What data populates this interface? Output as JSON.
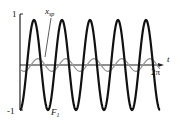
{
  "chart_data": {
    "type": "line",
    "title": "",
    "xlabel": "t",
    "ylabel": "",
    "x_range": [
      0,
      6.2832
    ],
    "xlim": [
      0,
      6.2832
    ],
    "ylim": [
      -1,
      1
    ],
    "grid": false,
    "legend": "none (inline labels)",
    "x_tick_labels": [
      "2π"
    ],
    "y_tick_labels": [
      "1",
      "-1"
    ],
    "series": [
      {
        "name": "F1",
        "label": "F₁",
        "color": "#111111",
        "width": 2.2,
        "formula": "-cos(5t)",
        "amplitude": 1.0,
        "frequency": 5,
        "phase": 0
      },
      {
        "name": "x_sp",
        "label": "x_sp",
        "color": "#9a9a9a",
        "width": 1.3,
        "formula": "-0.14*cos(5t - 0.9)",
        "amplitude": 0.14,
        "frequency": 5,
        "phase": 0.9
      }
    ],
    "annotations": [
      {
        "text": "x_sp",
        "points_to": "x_sp series"
      },
      {
        "text": "F₁",
        "points_to": "F1 series near trough"
      }
    ]
  },
  "labels": {
    "y_top": "1",
    "y_bottom": "-1",
    "x_axis": "t",
    "x_end": "2π",
    "xsp_main": "x",
    "xsp_sub": "sp",
    "f1_main": "F",
    "f1_sub": "1"
  }
}
